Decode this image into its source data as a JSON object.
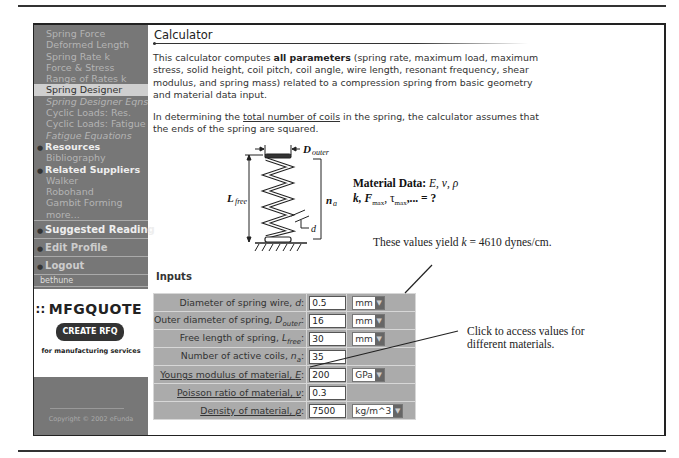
{
  "sidebar": {
    "items": [
      {
        "label": "Spring Force",
        "style": "normal"
      },
      {
        "label": "Deformed Length",
        "style": "normal"
      },
      {
        "label": "Spring Rate k",
        "style": "normal"
      },
      {
        "label": "Force & Stress",
        "style": "normal"
      },
      {
        "label": "Range of Rates k",
        "style": "normal"
      },
      {
        "label": "Spring Designer",
        "style": "active"
      },
      {
        "label": "Spring Designer Eqns",
        "style": "italic"
      },
      {
        "label": "Cyclic Loads: Res.",
        "style": "normal"
      },
      {
        "label": "Cyclic Loads: Fatigue",
        "style": "normal"
      },
      {
        "label": "Fatigue Equations",
        "style": "italic"
      }
    ],
    "resources_heading": "Resources",
    "resources": [
      "Bibliography"
    ],
    "suppliers_heading": "Related Suppliers",
    "suppliers": [
      "Walker",
      "Robohand",
      "Gambit Forming",
      "more..."
    ],
    "suggested_reading": "Suggested Reading",
    "edit_profile": "Edit Profile",
    "logout": "Logout",
    "username": "bethune",
    "promo": {
      "brand": "MFGQUOTE",
      "button": "CREATE RFQ",
      "tagline": "for manufacturing services"
    },
    "copyright": "Copyright © 2002 eFunda"
  },
  "main": {
    "title": "Calculator",
    "intro_pre": "This calculator computes ",
    "intro_bold": "all parameters",
    "intro_post": " (spring rate, maximum load, maximum stress, solid height, coil pitch, coil angle, wire length, resonant frequency, shear modulus, and spring mass) related to a compression spring from basic geometry and material data input.",
    "coils_pre": "In determining the ",
    "coils_link": "total number of coils",
    "coils_post": " in the spring, the calculator assumes that the ends of the spring are squared.",
    "figure": {
      "d_outer": "D",
      "d_outer_sub": "outer",
      "l_free": "L",
      "l_free_sub": "free",
      "n_a": "n",
      "n_a_sub": "a",
      "d": "d",
      "material_label": "Material Data: ",
      "material_syms": "E, ν, ρ",
      "outputs": "k, F",
      "outputs_max": "max",
      "outputs_tau": ", τ",
      "outputs_tail": ",... = ?"
    },
    "inputs_heading": "Inputs",
    "inputs": [
      {
        "label": "Diameter of spring wire, ",
        "sym": "d",
        "sub": "",
        "value": "0.5",
        "unit": "mm",
        "link": false
      },
      {
        "label": "Outer diameter of spring, ",
        "sym": "D",
        "sub": "outer",
        "value": "16",
        "unit": "mm",
        "link": false
      },
      {
        "label": "Free length of spring, ",
        "sym": "L",
        "sub": "free",
        "value": "30",
        "unit": "mm",
        "link": false
      },
      {
        "label": "Number of active coils, ",
        "sym": "n",
        "sub": "a",
        "value": "35",
        "unit": "",
        "link": false
      },
      {
        "label": "Youngs modulus of material, ",
        "sym": "E",
        "sub": "",
        "value": "200",
        "unit": "GPa",
        "link": true
      },
      {
        "label": "Poisson ratio of material, ",
        "sym": "ν",
        "sub": "",
        "value": "0.3",
        "unit": "",
        "link": true
      },
      {
        "label": "Density of material, ",
        "sym": "ρ",
        "sub": "",
        "value": "7500",
        "unit": "kg/m^3",
        "link": true
      }
    ]
  },
  "annotations": {
    "yield_pre": "These values yield ",
    "yield_k": "k",
    "yield_post": " = 4610 dynes/cm.",
    "click_note": "Click to access values for different materials."
  }
}
